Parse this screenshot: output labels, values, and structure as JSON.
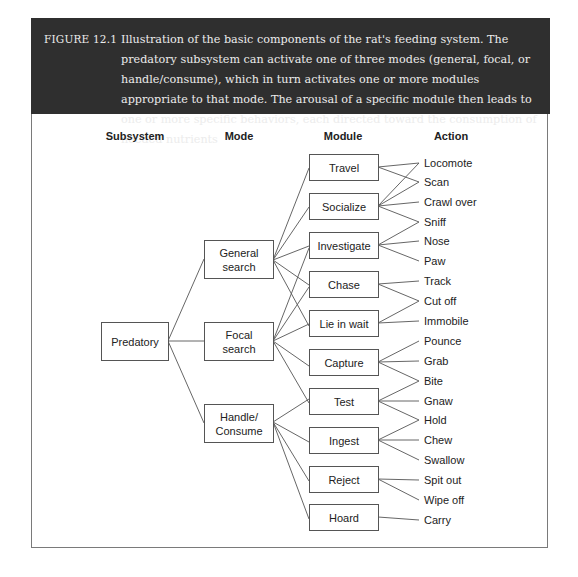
{
  "caption": {
    "label": "FIGURE 12.1",
    "text": "Illustration of the basic components of the rat's feeding system. The predatory subsystem can activate one of three modes (general, focal, or handle/consume), which in turn activates one or more modules appropriate to that mode. The arousal of a specific module then leads to one or more specific behaviors, each directed toward the consumption of needed nutrients",
    "background": "#2f2f2f",
    "text_color": "#ececec"
  },
  "columns": {
    "subsystem": "Subsystem",
    "mode": "Mode",
    "module": "Module",
    "action": "Action"
  },
  "subsystem": {
    "label": "Predatory"
  },
  "modes": [
    {
      "id": "general",
      "label": "General search"
    },
    {
      "id": "focal",
      "label": "Focal search"
    },
    {
      "id": "handle",
      "label": "Handle/ Consume"
    }
  ],
  "modules": [
    {
      "id": "travel",
      "label": "Travel"
    },
    {
      "id": "socialize",
      "label": "Socialize"
    },
    {
      "id": "investigate",
      "label": "Investigate"
    },
    {
      "id": "chase",
      "label": "Chase"
    },
    {
      "id": "liewait",
      "label": "Lie in wait"
    },
    {
      "id": "capture",
      "label": "Capture"
    },
    {
      "id": "test",
      "label": "Test"
    },
    {
      "id": "ingest",
      "label": "Ingest"
    },
    {
      "id": "reject",
      "label": "Reject"
    },
    {
      "id": "hoard",
      "label": "Hoard"
    }
  ],
  "actions": [
    "Locomote",
    "Scan",
    "Crawl over",
    "Sniff",
    "Nose",
    "Paw",
    "Track",
    "Cut off",
    "Immobile",
    "Pounce",
    "Grab",
    "Bite",
    "Gnaw",
    "Hold",
    "Chew",
    "Swallow",
    "Spit out",
    "Wipe off",
    "Carry"
  ],
  "edges": {
    "subsystem_to_mode": [
      "general",
      "focal",
      "handle"
    ],
    "mode_to_module": {
      "general": [
        "travel",
        "socialize",
        "investigate",
        "chase",
        "liewait"
      ],
      "focal": [
        "investigate",
        "chase",
        "liewait",
        "capture",
        "test"
      ],
      "handle": [
        "test",
        "ingest",
        "reject",
        "hoard"
      ]
    },
    "module_to_action": {
      "travel": [
        "Locomote",
        "Scan"
      ],
      "socialize": [
        "Locomote",
        "Scan",
        "Crawl over",
        "Sniff"
      ],
      "investigate": [
        "Sniff",
        "Nose",
        "Paw"
      ],
      "chase": [
        "Track",
        "Cut off"
      ],
      "liewait": [
        "Cut off",
        "Immobile"
      ],
      "capture": [
        "Pounce",
        "Grab",
        "Bite"
      ],
      "test": [
        "Bite",
        "Gnaw",
        "Hold"
      ],
      "ingest": [
        "Hold",
        "Chew",
        "Swallow"
      ],
      "reject": [
        "Spit out",
        "Wipe off"
      ],
      "hoard": [
        "Carry"
      ]
    }
  }
}
